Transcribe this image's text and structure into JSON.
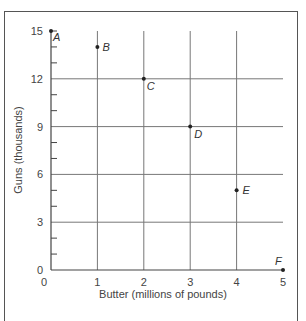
{
  "chart_data": {
    "type": "scatter",
    "title": "",
    "xlabel": "Butter (millions of pounds)",
    "ylabel": "Guns (thousands)",
    "xlim": [
      0,
      5
    ],
    "ylim": [
      0,
      15
    ],
    "x_ticks": [
      "0",
      "1",
      "2",
      "3",
      "4",
      "5"
    ],
    "y_ticks": [
      "0",
      "3",
      "6",
      "9",
      "12",
      "15"
    ],
    "grid": true,
    "legend": null,
    "points": [
      {
        "label": "A",
        "x": 0,
        "y": 15
      },
      {
        "label": "B",
        "x": 1,
        "y": 14
      },
      {
        "label": "C",
        "x": 2,
        "y": 12
      },
      {
        "label": "D",
        "x": 3,
        "y": 9
      },
      {
        "label": "E",
        "x": 4,
        "y": 5
      },
      {
        "label": "F",
        "x": 5,
        "y": 0
      }
    ]
  },
  "colors": {
    "grid": "#777777",
    "axis": "#444444",
    "point": "#222222"
  }
}
